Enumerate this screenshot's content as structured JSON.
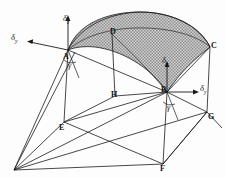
{
  "figure": {
    "background_color": "#fdfdfd",
    "line_color": "#1a1a1a",
    "surface_fill": "#b3b3b3"
  },
  "vertices": [
    {
      "id": "A",
      "label": "A",
      "x": 68,
      "y": 50
    },
    {
      "id": "B",
      "label": "B",
      "x": 167,
      "y": 92
    },
    {
      "id": "C",
      "label": "C",
      "x": 210,
      "y": 47
    },
    {
      "id": "D",
      "label": "D",
      "x": 112,
      "y": 34
    },
    {
      "id": "E",
      "label": "E",
      "x": 64,
      "y": 122
    },
    {
      "id": "F",
      "label": "F",
      "x": 163,
      "y": 164
    },
    {
      "id": "G",
      "label": "G",
      "x": 207,
      "y": 112
    },
    {
      "id": "H",
      "label": "H",
      "x": 115,
      "y": 96
    }
  ],
  "axis_labels": [
    {
      "id": "delta-z-A",
      "symbol": "δ",
      "subscript": "z",
      "x": 64,
      "y": 16,
      "direction": "up"
    },
    {
      "id": "delta-y-A",
      "symbol": "δ",
      "subscript": "y",
      "x": 11,
      "y": 38,
      "direction": "left"
    },
    {
      "id": "delta-z-B",
      "symbol": "δ",
      "subscript": "z",
      "x": 160,
      "y": 58,
      "direction": "up"
    },
    {
      "id": "delta-y-B",
      "symbol": "δ",
      "subscript": "y",
      "x": 184,
      "y": 85,
      "direction": "right"
    }
  ],
  "angle_labels": [
    {
      "id": "gamma-A",
      "symbol": "γ",
      "x": 70,
      "y": 64
    },
    {
      "id": "gamma-B",
      "symbol": "γ",
      "x": 169,
      "y": 107
    }
  ],
  "vanishing_point": {
    "x": 14,
    "y": 170
  }
}
